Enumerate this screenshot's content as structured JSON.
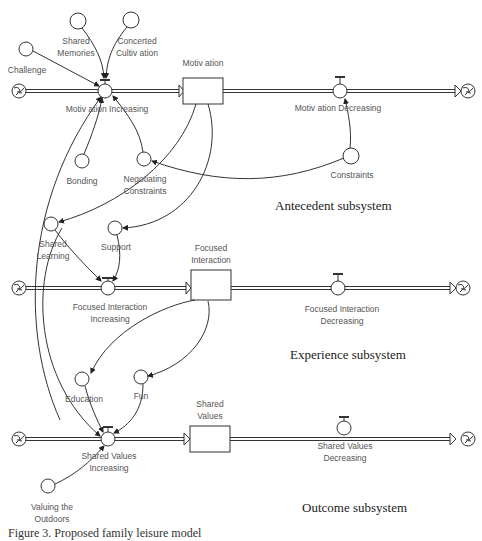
{
  "diagram": {
    "type": "stock-and-flow",
    "subsystems": [
      {
        "label": "Antecedent subsystem",
        "x": 280,
        "y": 200
      },
      {
        "label": "Experience subsystem",
        "x": 290,
        "y": 349
      },
      {
        "label": "Outcome subsystem",
        "x": 300,
        "y": 502
      }
    ],
    "stocks": [
      {
        "id": "motivation",
        "label": "Motiv ation",
        "x": 183,
        "y": 78,
        "w": 40,
        "h": 28
      },
      {
        "id": "focused_interaction",
        "label_l1": "Focused",
        "label_l2": "Interaction",
        "x": 191,
        "y": 270,
        "w": 40,
        "h": 30
      },
      {
        "id": "shared_values",
        "label_l1": "Shared",
        "label_l2": "Values",
        "x": 190,
        "y": 426,
        "w": 40,
        "h": 26
      }
    ],
    "flows": [
      {
        "id": "motivation_increasing",
        "label": "Motiv ation Increasing"
      },
      {
        "id": "motivation_decreasing",
        "label": "Motiv ation Decreasing"
      },
      {
        "id": "focused_interaction_increasing",
        "label_l1": "Focused Interaction",
        "label_l2": "Increasing"
      },
      {
        "id": "focused_interaction_decreasing",
        "label_l1": "Focused Interaction",
        "label_l2": "Decreasing"
      },
      {
        "id": "shared_values_increasing",
        "label_l1": "Shared Values",
        "label_l2": "Increasing"
      },
      {
        "id": "shared_values_decreasing",
        "label_l1": "Shared Values",
        "label_l2": "Decreasing"
      }
    ],
    "converters": [
      {
        "id": "challenge",
        "label": "Challenge"
      },
      {
        "id": "shared_memories",
        "label_l1": "Shared",
        "label_l2": "Memories"
      },
      {
        "id": "concerted_cultivation",
        "label_l1": "Concerted",
        "label_l2": "Cultiv ation"
      },
      {
        "id": "bonding",
        "label": "Bonding"
      },
      {
        "id": "negotiating_constraints",
        "label_l1": "Negotiating",
        "label_l2": "Constraints"
      },
      {
        "id": "constraints",
        "label": "Constraints"
      },
      {
        "id": "shared_learning",
        "label_l1": "Shared",
        "label_l2": "Learning"
      },
      {
        "id": "support",
        "label": "Support"
      },
      {
        "id": "education",
        "label": "Education"
      },
      {
        "id": "fun",
        "label": "Fun"
      },
      {
        "id": "valuing_outdoors",
        "label_l1": "Valuing the",
        "label_l2": "Outdoors"
      }
    ],
    "caption": "Figure 3. Proposed family leisure model"
  },
  "colors": {
    "line": "#333333",
    "text": "#555555",
    "background": "#ffffff"
  }
}
